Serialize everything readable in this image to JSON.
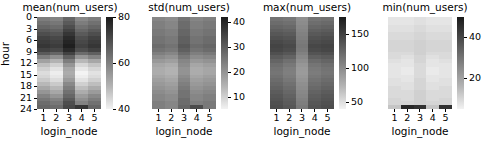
{
  "figure": {
    "background": "#ffffff",
    "colormap": "grayscale-reversed",
    "ylabel": "hour",
    "xlabel": "login_node"
  },
  "chart_data": [
    {
      "type": "heatmap",
      "title": "mean(num_users)",
      "xlabel": "login_node",
      "ylabel": "hour",
      "x": [
        "1",
        "2",
        "3",
        "4",
        "5"
      ],
      "xticklabels": [
        "1",
        "2",
        "3",
        "4",
        "5"
      ],
      "yticklabels": [
        "0",
        "3",
        "6",
        "9",
        "12",
        "15",
        "18",
        "21",
        "24"
      ],
      "ylim": [
        0,
        24
      ],
      "colorbar_ticks": [
        "80",
        "60",
        "40"
      ],
      "colorbar_range": [
        40,
        80
      ],
      "grid": false,
      "values": [
        [
          62,
          61,
          66,
          60,
          62
        ],
        [
          64,
          63,
          68,
          62,
          64
        ],
        [
          66,
          65,
          70,
          64,
          66
        ],
        [
          68,
          67,
          72,
          66,
          68
        ],
        [
          70,
          69,
          74,
          68,
          70
        ],
        [
          72,
          71,
          76,
          70,
          72
        ],
        [
          73,
          72,
          77,
          71,
          73
        ],
        [
          74,
          73,
          78,
          72,
          74
        ],
        [
          72,
          71,
          76,
          70,
          72
        ],
        [
          68,
          66,
          72,
          65,
          67
        ],
        [
          62,
          59,
          67,
          58,
          61
        ],
        [
          56,
          53,
          62,
          52,
          55
        ],
        [
          51,
          48,
          58,
          47,
          50
        ],
        [
          48,
          45,
          55,
          44,
          47
        ],
        [
          46,
          43,
          54,
          42,
          45
        ],
        [
          47,
          44,
          55,
          43,
          46
        ],
        [
          49,
          46,
          57,
          45,
          48
        ],
        [
          52,
          49,
          60,
          48,
          51
        ],
        [
          55,
          52,
          62,
          51,
          54
        ],
        [
          58,
          55,
          64,
          54,
          57
        ],
        [
          61,
          58,
          66,
          57,
          60
        ],
        [
          63,
          61,
          68,
          59,
          62
        ],
        [
          65,
          63,
          70,
          61,
          64
        ],
        [
          66,
          65,
          71,
          74,
          66
        ]
      ]
    },
    {
      "type": "heatmap",
      "title": "std(num_users)",
      "xlabel": "login_node",
      "ylabel": "hour",
      "x": [
        "1",
        "2",
        "3",
        "4",
        "5"
      ],
      "xticklabels": [
        "1",
        "2",
        "3",
        "4",
        "5"
      ],
      "yticklabels": [
        "0",
        "3",
        "6",
        "9",
        "12",
        "15",
        "18",
        "21",
        "24"
      ],
      "ylim": [
        0,
        24
      ],
      "colorbar_ticks": [
        "40",
        "30",
        "20",
        "10"
      ],
      "colorbar_range": [
        5,
        42
      ],
      "grid": false,
      "values": [
        [
          24,
          23,
          27,
          24,
          25
        ],
        [
          25,
          24,
          28,
          25,
          26
        ],
        [
          25,
          24,
          28,
          25,
          26
        ],
        [
          26,
          25,
          29,
          26,
          27
        ],
        [
          26,
          25,
          29,
          26,
          27
        ],
        [
          27,
          26,
          30,
          27,
          28
        ],
        [
          27,
          26,
          30,
          27,
          28
        ],
        [
          28,
          27,
          31,
          28,
          29
        ],
        [
          27,
          26,
          30,
          27,
          28
        ],
        [
          25,
          24,
          28,
          25,
          26
        ],
        [
          23,
          22,
          26,
          23,
          24
        ],
        [
          21,
          20,
          24,
          21,
          22
        ],
        [
          19,
          18,
          23,
          19,
          20
        ],
        [
          18,
          17,
          22,
          18,
          19
        ],
        [
          18,
          17,
          22,
          18,
          19
        ],
        [
          19,
          18,
          23,
          19,
          20
        ],
        [
          20,
          19,
          24,
          20,
          21
        ],
        [
          21,
          20,
          25,
          21,
          22
        ],
        [
          22,
          21,
          26,
          22,
          23
        ],
        [
          23,
          22,
          27,
          23,
          24
        ],
        [
          24,
          23,
          27,
          24,
          25
        ],
        [
          24,
          23,
          28,
          24,
          25
        ],
        [
          25,
          24,
          28,
          25,
          26
        ],
        [
          25,
          24,
          29,
          33,
          26
        ]
      ]
    },
    {
      "type": "heatmap",
      "title": "max(num_users)",
      "xlabel": "login_node",
      "ylabel": "hour",
      "x": [
        "1",
        "2",
        "3",
        "4",
        "5"
      ],
      "xticklabels": [
        "1",
        "2",
        "3",
        "4",
        "5"
      ],
      "yticklabels": [
        "0",
        "3",
        "6",
        "9",
        "12",
        "15",
        "18",
        "21",
        "24"
      ],
      "ylim": [
        0,
        24
      ],
      "colorbar_ticks": [
        "150",
        "100",
        "50"
      ],
      "colorbar_range": [
        40,
        175
      ],
      "grid": false,
      "values": [
        [
          120,
          118,
          104,
          119,
          121
        ],
        [
          124,
          122,
          106,
          123,
          125
        ],
        [
          128,
          126,
          108,
          127,
          129
        ],
        [
          132,
          130,
          110,
          131,
          133
        ],
        [
          136,
          134,
          112,
          135,
          137
        ],
        [
          140,
          138,
          114,
          139,
          141
        ],
        [
          144,
          141,
          116,
          142,
          144
        ],
        [
          147,
          144,
          118,
          145,
          147
        ],
        [
          145,
          142,
          116,
          143,
          145
        ],
        [
          140,
          136,
          112,
          138,
          140
        ],
        [
          134,
          129,
          108,
          131,
          134
        ],
        [
          128,
          122,
          104,
          124,
          128
        ],
        [
          123,
          117,
          100,
          119,
          123
        ],
        [
          120,
          114,
          98,
          116,
          120
        ],
        [
          119,
          113,
          97,
          115,
          119
        ],
        [
          121,
          115,
          99,
          117,
          121
        ],
        [
          124,
          118,
          101,
          120,
          124
        ],
        [
          127,
          121,
          104,
          123,
          127
        ],
        [
          130,
          124,
          106,
          126,
          130
        ],
        [
          133,
          127,
          108,
          129,
          133
        ],
        [
          136,
          130,
          110,
          132,
          136
        ],
        [
          138,
          132,
          112,
          134,
          138
        ],
        [
          140,
          134,
          114,
          136,
          140
        ],
        [
          142,
          136,
          116,
          138,
          142
        ]
      ]
    },
    {
      "type": "heatmap",
      "title": "min(num_users)",
      "xlabel": "login_node",
      "ylabel": "hour",
      "x": [
        "1",
        "2",
        "3",
        "4",
        "5"
      ],
      "xticklabels": [
        "1",
        "2",
        "3",
        "4",
        "5"
      ],
      "yticklabels": [
        "0",
        "3",
        "6",
        "9",
        "12",
        "15",
        "18",
        "21",
        "24"
      ],
      "ylim": [
        0,
        24
      ],
      "colorbar_ticks": [
        "40",
        "20"
      ],
      "colorbar_range": [
        5,
        50
      ],
      "grid": false,
      "values": [
        [
          10,
          10,
          11,
          10,
          10
        ],
        [
          10,
          10,
          11,
          10,
          10
        ],
        [
          11,
          11,
          12,
          11,
          11
        ],
        [
          11,
          11,
          12,
          11,
          11
        ],
        [
          12,
          12,
          13,
          12,
          12
        ],
        [
          12,
          12,
          13,
          12,
          12
        ],
        [
          13,
          13,
          14,
          13,
          13
        ],
        [
          13,
          13,
          14,
          13,
          13
        ],
        [
          13,
          13,
          14,
          13,
          13
        ],
        [
          12,
          12,
          14,
          12,
          12
        ],
        [
          12,
          11,
          13,
          11,
          12
        ],
        [
          11,
          10,
          13,
          10,
          11
        ],
        [
          10,
          10,
          12,
          10,
          10
        ],
        [
          10,
          9,
          12,
          9,
          10
        ],
        [
          10,
          9,
          12,
          9,
          10
        ],
        [
          10,
          10,
          12,
          10,
          10
        ],
        [
          11,
          10,
          13,
          10,
          11
        ],
        [
          11,
          11,
          13,
          11,
          11
        ],
        [
          12,
          11,
          13,
          11,
          12
        ],
        [
          12,
          12,
          14,
          12,
          12
        ],
        [
          12,
          12,
          14,
          12,
          12
        ],
        [
          13,
          12,
          14,
          12,
          13
        ],
        [
          13,
          13,
          14,
          13,
          13
        ],
        [
          16,
          46,
          44,
          16,
          44
        ]
      ]
    }
  ]
}
